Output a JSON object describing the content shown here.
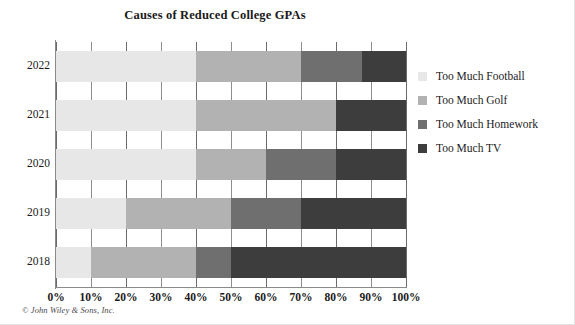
{
  "chart_data": {
    "type": "bar",
    "orientation": "horizontal",
    "stacked": true,
    "normalized_percent": true,
    "title": "Causes of Reduced College GPAs",
    "xlabel": "",
    "ylabel": "",
    "xlim": [
      0,
      100
    ],
    "xticks": [
      "0%",
      "10%",
      "20%",
      "30%",
      "40%",
      "50%",
      "60%",
      "70%",
      "80%",
      "90%",
      "100%"
    ],
    "xtick_values": [
      0,
      10,
      20,
      30,
      40,
      50,
      60,
      70,
      80,
      90,
      100
    ],
    "grid": true,
    "legend_position": "right",
    "categories": [
      "2022",
      "2021",
      "2020",
      "2019",
      "2018"
    ],
    "series": [
      {
        "name": "Too Much Football",
        "color": "#e7e7e7",
        "values": [
          40,
          40,
          40,
          20,
          10
        ]
      },
      {
        "name": "Too Much Golf",
        "color": "#b2b2b2",
        "values": [
          30,
          40,
          20,
          30,
          30
        ]
      },
      {
        "name": "Too Much Homework",
        "color": "#6f6f6f",
        "values": [
          17.5,
          0,
          20,
          20,
          10
        ]
      },
      {
        "name": "Too Much TV",
        "color": "#3d3d3d",
        "values": [
          12.5,
          20,
          20,
          30,
          50
        ]
      }
    ],
    "cumulative_boundaries": {
      "2022": [
        40,
        70,
        87.5,
        100
      ],
      "2021": [
        40,
        80,
        80,
        100
      ],
      "2020": [
        40,
        60,
        80,
        100
      ],
      "2019": [
        20,
        50,
        70,
        100
      ],
      "2018": [
        10,
        40,
        50,
        100
      ]
    }
  },
  "legend": {
    "items": [
      {
        "label": "Too Much Football",
        "color": "#e7e7e7"
      },
      {
        "label": "Too Much Golf",
        "color": "#b2b2b2"
      },
      {
        "label": "Too Much Homework",
        "color": "#6f6f6f"
      },
      {
        "label": "Too Much TV",
        "color": "#3d3d3d"
      }
    ]
  },
  "credit": "© John Wiley & Sons, Inc."
}
